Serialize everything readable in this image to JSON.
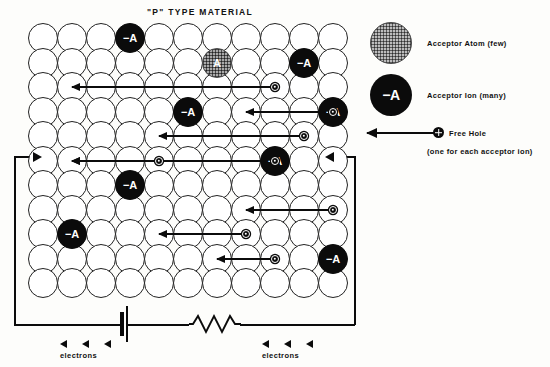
{
  "title": "\"P\" TYPE MATERIAL",
  "lattice": {
    "cols": 11,
    "rows": 11,
    "cell": 29,
    "row_step": 24.5,
    "ion_label": "−A",
    "acceptor_label": "A",
    "ions": [
      {
        "col": 3,
        "row": 0
      },
      {
        "col": 9,
        "row": 1
      },
      {
        "col": 5,
        "row": 3
      },
      {
        "col": 10,
        "row": 3
      },
      {
        "col": 8,
        "row": 5
      },
      {
        "col": 3,
        "row": 6
      },
      {
        "col": 1,
        "row": 8
      },
      {
        "col": 10,
        "row": 9
      }
    ],
    "acceptor_atoms": [
      {
        "col": 6,
        "row": 1
      }
    ],
    "hole_arrows": [
      {
        "row": 2,
        "from_col": 8,
        "to_col": 1
      },
      {
        "row": 3,
        "from_col": 10,
        "to_col": 7
      },
      {
        "row": 4,
        "from_col": 9,
        "to_col": 4
      },
      {
        "row": 5,
        "from_col": 8,
        "to_col": 1
      },
      {
        "row": 5,
        "from_col": 4,
        "to_col": 1
      },
      {
        "row": 7,
        "from_col": 10,
        "to_col": 7
      },
      {
        "row": 8,
        "from_col": 7,
        "to_col": 4
      },
      {
        "row": 9,
        "from_col": 8,
        "to_col": 6
      }
    ]
  },
  "circuit": {
    "battery_name": "battery",
    "resistor_name": "resistor",
    "electrons_label_left": "electrons",
    "electrons_label_right": "electrons",
    "arrowhead_count": 3
  },
  "legend": {
    "acceptor_atom_label": "Acceptor Atom (few)",
    "acceptor_ion_symbol": "−A",
    "acceptor_ion_label": "Acceptor Ion (many)",
    "free_hole_label": "Free Hole",
    "free_hole_sub": "(one for each acceptor ion)"
  },
  "colors": {
    "ink": "#0b0b0b",
    "paper": "#fdfdfb",
    "acceptor_fill": "#a9a9a9"
  }
}
